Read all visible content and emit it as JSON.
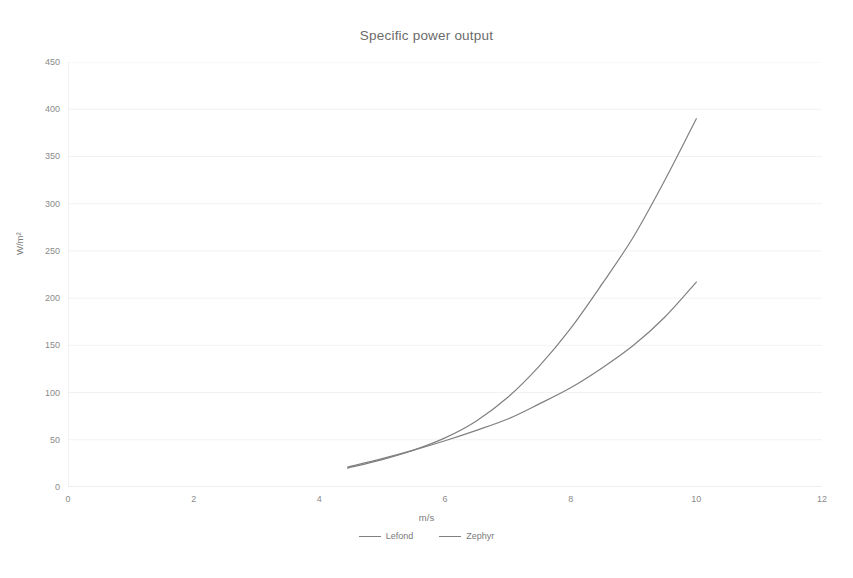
{
  "chart_data": {
    "type": "line",
    "title": "Specific power output",
    "xlabel": "m/s",
    "ylabel": "W/m²",
    "xlim": [
      0,
      12
    ],
    "ylim": [
      0,
      450
    ],
    "xticks": [
      0,
      2,
      4,
      6,
      8,
      10,
      12
    ],
    "yticks": [
      0,
      50,
      100,
      150,
      200,
      250,
      300,
      350,
      400,
      450
    ],
    "xtick_labels": [
      "0",
      "2",
      "4",
      "6",
      "8",
      "10",
      "12"
    ],
    "ytick_labels": [
      "0",
      "50",
      "100",
      "150",
      "200",
      "250",
      "300",
      "350",
      "400",
      "450"
    ],
    "grid": true,
    "grid_color": "#f2f2f2",
    "line_color": "#808080",
    "legend_position": "bottom",
    "series": [
      {
        "name": "Lefond",
        "color": "#808080",
        "x": [
          4.45,
          5.0,
          5.5,
          6.0,
          6.5,
          7.0,
          7.5,
          8.0,
          8.5,
          9.0,
          9.5,
          10.0
        ],
        "values": [
          20,
          29,
          39,
          52,
          70,
          95,
          128,
          168,
          215,
          265,
          325,
          390
        ]
      },
      {
        "name": "Zephyr",
        "color": "#808080",
        "x": [
          4.45,
          5.0,
          5.5,
          6.0,
          6.5,
          7.0,
          7.5,
          8.0,
          8.5,
          9.0,
          9.5,
          10.0
        ],
        "values": [
          21,
          30,
          39,
          49,
          60,
          72,
          88,
          105,
          126,
          150,
          180,
          217
        ]
      }
    ]
  },
  "legend": {
    "items": [
      {
        "label": "Lefond"
      },
      {
        "label": "Zephyr"
      }
    ]
  }
}
